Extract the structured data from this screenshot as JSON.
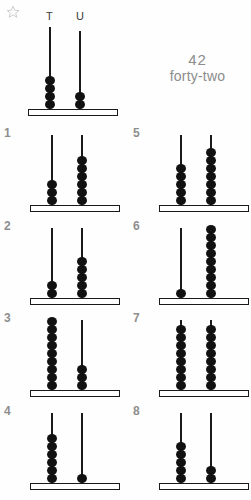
{
  "worksheet": {
    "star_icon": "star-icon",
    "columns": {
      "tens_label": "T",
      "units_label": "U"
    },
    "colors": {
      "bead": "#111111",
      "rod": "#1a1a1a",
      "base_fill": "#ffffff",
      "base_stroke": "#1a1a1a",
      "answer_text": "#8c8c8c",
      "problem_number": "#8e8e8e",
      "page_background": "#fefefe"
    },
    "example": {
      "tens_beads": 4,
      "units_beads": 2,
      "answer_number": "42",
      "answer_word": "forty-two"
    },
    "problems": [
      {
        "number": "1",
        "tens_beads": 3,
        "units_beads": 6
      },
      {
        "number": "2",
        "tens_beads": 2,
        "units_beads": 5
      },
      {
        "number": "3",
        "tens_beads": 9,
        "units_beads": 3
      },
      {
        "number": "4",
        "tens_beads": 6,
        "units_beads": 1
      },
      {
        "number": "5",
        "tens_beads": 5,
        "units_beads": 7
      },
      {
        "number": "6",
        "tens_beads": 1,
        "units_beads": 9
      },
      {
        "number": "7",
        "tens_beads": 8,
        "units_beads": 8
      },
      {
        "number": "8",
        "tens_beads": 5,
        "units_beads": 2
      }
    ]
  }
}
